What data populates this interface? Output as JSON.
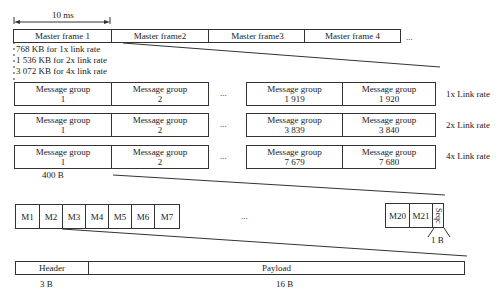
{
  "timing": {
    "duration_label": "10 ms"
  },
  "master_frames": {
    "items": [
      {
        "label": "Master frame 1"
      },
      {
        "label": "Master frame2"
      },
      {
        "label": "Master frame3"
      },
      {
        "label": "Master frame 4"
      }
    ],
    "ellipsis": "..."
  },
  "frame_sizes": [
    {
      "label": "768 KB for 1x link rate"
    },
    {
      "label": "1 536 KB for 2x link rate"
    },
    {
      "label": "3 072 KB for 4x link rate"
    }
  ],
  "message_group_rows": [
    {
      "rate_label": "1x Link rate",
      "groups": [
        {
          "title": "Message group",
          "num": "1"
        },
        {
          "title": "Message group",
          "num": "2"
        },
        {
          "title": "Message group",
          "num": "1 919"
        },
        {
          "title": "Message group",
          "num": "1 920"
        }
      ],
      "ellipsis": "..."
    },
    {
      "rate_label": "2x Link rate",
      "groups": [
        {
          "title": "Message group",
          "num": "1"
        },
        {
          "title": "Message group",
          "num": "2"
        },
        {
          "title": "Message group",
          "num": "3 839"
        },
        {
          "title": "Message group",
          "num": "3 840"
        }
      ],
      "ellipsis": "..."
    },
    {
      "rate_label": "4x Link rate",
      "groups": [
        {
          "title": "Message group",
          "num": "1"
        },
        {
          "title": "Message group",
          "num": "2"
        },
        {
          "title": "Message group",
          "num": "7 679"
        },
        {
          "title": "Message group",
          "num": "7 680"
        }
      ],
      "ellipsis": "..."
    }
  ],
  "message_group_size": "400 B",
  "messages": {
    "items": [
      "M1",
      "M2",
      "M3",
      "M4",
      "M5",
      "M6",
      "M7"
    ],
    "tail_items": [
      "M20",
      "M21"
    ],
    "seq_label": "Seqc",
    "seq_size": "1 B",
    "ellipsis": "..."
  },
  "message_structure": {
    "header": {
      "label": "Header",
      "size": "3 B"
    },
    "payload": {
      "label": "Payload",
      "size": "16 B"
    }
  }
}
